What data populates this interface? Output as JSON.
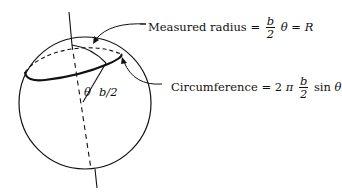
{
  "diagram": {
    "labels": {
      "measured_radius": {
        "text": "Measured radius =",
        "frac_num": "b",
        "frac_den": "2",
        "suffix_theta": "θ",
        "eq": "=",
        "result": "R"
      },
      "circumference": {
        "text": "Circumference =",
        "coef": "2",
        "pi": "π",
        "frac_num": "b",
        "frac_den": "2",
        "sin": "sin",
        "theta": "θ"
      },
      "angle": "θ",
      "radius": "b/2"
    },
    "colors": {
      "stroke": "#111111",
      "background": "#ffffff"
    }
  }
}
